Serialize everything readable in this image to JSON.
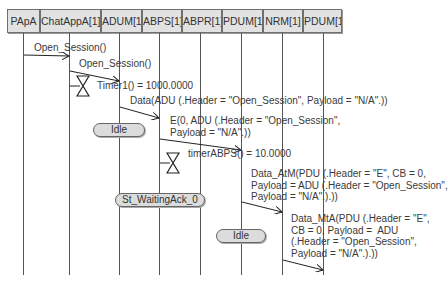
{
  "lifelines": [
    {
      "name": "PApA"
    },
    {
      "name": "ChatAppA[1]"
    },
    {
      "name": "ADUM[1]"
    },
    {
      "name": "ABPS[1]"
    },
    {
      "name": "ABPR[1]"
    },
    {
      "name": "PDUM[1]"
    },
    {
      "name": "NRM[1]"
    },
    {
      "name": "PDUM[1]"
    }
  ],
  "messages": [
    {
      "label": "Open_Session()",
      "from": "PApA",
      "to": "ChatAppA[1]"
    },
    {
      "label": "Open_Session()",
      "from": "ChatAppA[1]",
      "to": "ADUM[1]"
    },
    {
      "label": "Data(ADU (.Header = \"Open_Session\", Payload = \"N/A\".))",
      "from": "ADUM[1]",
      "to": "ABPS[1]"
    },
    {
      "label": "E(0, ADU (.Header = \"Open_Session\",\nPayload = \"N/A\".))",
      "from": "ABPS[1]",
      "to": "PDUM[1]"
    },
    {
      "label": "Data_AtM(PDU (.Header = \"E\", CB = 0,\nPayload = ADU (.Header = \"Open_Session\",\nPayload = \"N/A\".).))",
      "from": "PDUM[1]",
      "to": "NRM[1]"
    },
    {
      "label": "Data_MtA(PDU (.Header = \"E\",\nCB = 0, Payload =  ADU\n(.Header = \"Open_Session\",\nPayload = \"N/A\".).))",
      "from": "NRM[1]",
      "to": "PDUM[1]"
    }
  ],
  "timers": [
    {
      "label": "Timer1() = 1000.0000",
      "lifeline": "ChatAppA[1]"
    },
    {
      "label": "timerABPS() = 10.0000",
      "lifeline": "ABPS[1]"
    }
  ],
  "states": [
    {
      "label": "Idle",
      "lifeline": "ADUM[1]"
    },
    {
      "label": "St_WaitingAck_0",
      "lifeline": "ABPS[1]"
    },
    {
      "label": "Idle",
      "lifeline": "PDUM[1]"
    }
  ]
}
